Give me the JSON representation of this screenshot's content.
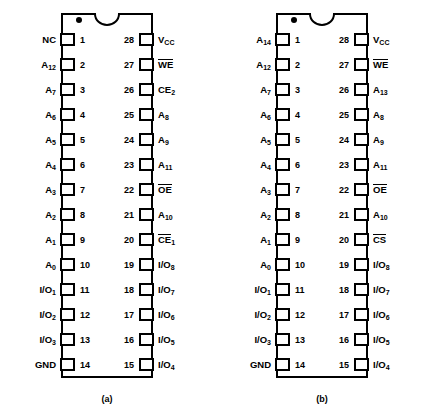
{
  "figure": {
    "pin_count": 28,
    "package": "28-pin DIP",
    "notch": "top-center-semicircle",
    "pin1_marker": "dot"
  },
  "chips": [
    {
      "caption": "(a)",
      "left_pins": [
        {
          "num": "1",
          "sig": "NC",
          "sub": "",
          "bar": false
        },
        {
          "num": "2",
          "sig": "A",
          "sub": "12",
          "bar": false
        },
        {
          "num": "3",
          "sig": "A",
          "sub": "7",
          "bar": false
        },
        {
          "num": "4",
          "sig": "A",
          "sub": "6",
          "bar": false
        },
        {
          "num": "5",
          "sig": "A",
          "sub": "5",
          "bar": false
        },
        {
          "num": "6",
          "sig": "A",
          "sub": "4",
          "bar": false
        },
        {
          "num": "7",
          "sig": "A",
          "sub": "3",
          "bar": false
        },
        {
          "num": "8",
          "sig": "A",
          "sub": "2",
          "bar": false
        },
        {
          "num": "9",
          "sig": "A",
          "sub": "1",
          "bar": false
        },
        {
          "num": "10",
          "sig": "A",
          "sub": "0",
          "bar": false
        },
        {
          "num": "11",
          "sig": "I/O",
          "sub": "1",
          "bar": false
        },
        {
          "num": "12",
          "sig": "I/O",
          "sub": "2",
          "bar": false
        },
        {
          "num": "13",
          "sig": "I/O",
          "sub": "3",
          "bar": false
        },
        {
          "num": "14",
          "sig": "GND",
          "sub": "",
          "bar": false
        }
      ],
      "right_pins": [
        {
          "num": "28",
          "sig": "V",
          "sub": "CC",
          "bar": false
        },
        {
          "num": "27",
          "sig": "WE",
          "sub": "",
          "bar": true
        },
        {
          "num": "26",
          "sig": "CE",
          "sub": "2",
          "bar": false
        },
        {
          "num": "25",
          "sig": "A",
          "sub": "8",
          "bar": false
        },
        {
          "num": "24",
          "sig": "A",
          "sub": "9",
          "bar": false
        },
        {
          "num": "23",
          "sig": "A",
          "sub": "11",
          "bar": false
        },
        {
          "num": "22",
          "sig": "OE",
          "sub": "",
          "bar": true
        },
        {
          "num": "21",
          "sig": "A",
          "sub": "10",
          "bar": false
        },
        {
          "num": "20",
          "sig": "CE",
          "sub": "1",
          "bar": true
        },
        {
          "num": "19",
          "sig": "I/O",
          "sub": "8",
          "bar": false
        },
        {
          "num": "18",
          "sig": "I/O",
          "sub": "7",
          "bar": false
        },
        {
          "num": "17",
          "sig": "I/O",
          "sub": "6",
          "bar": false
        },
        {
          "num": "16",
          "sig": "I/O",
          "sub": "5",
          "bar": false
        },
        {
          "num": "15",
          "sig": "I/O",
          "sub": "4",
          "bar": false
        }
      ]
    },
    {
      "caption": "(b)",
      "left_pins": [
        {
          "num": "1",
          "sig": "A",
          "sub": "14",
          "bar": false
        },
        {
          "num": "2",
          "sig": "A",
          "sub": "12",
          "bar": false
        },
        {
          "num": "3",
          "sig": "A",
          "sub": "7",
          "bar": false
        },
        {
          "num": "4",
          "sig": "A",
          "sub": "6",
          "bar": false
        },
        {
          "num": "5",
          "sig": "A",
          "sub": "5",
          "bar": false
        },
        {
          "num": "6",
          "sig": "A",
          "sub": "4",
          "bar": false
        },
        {
          "num": "7",
          "sig": "A",
          "sub": "3",
          "bar": false
        },
        {
          "num": "8",
          "sig": "A",
          "sub": "2",
          "bar": false
        },
        {
          "num": "9",
          "sig": "A",
          "sub": "1",
          "bar": false
        },
        {
          "num": "10",
          "sig": "A",
          "sub": "0",
          "bar": false
        },
        {
          "num": "11",
          "sig": "I/O",
          "sub": "1",
          "bar": false
        },
        {
          "num": "12",
          "sig": "I/O",
          "sub": "2",
          "bar": false
        },
        {
          "num": "13",
          "sig": "I/O",
          "sub": "3",
          "bar": false
        },
        {
          "num": "14",
          "sig": "GND",
          "sub": "",
          "bar": false
        }
      ],
      "right_pins": [
        {
          "num": "28",
          "sig": "V",
          "sub": "CC",
          "bar": false
        },
        {
          "num": "27",
          "sig": "WE",
          "sub": "",
          "bar": true
        },
        {
          "num": "26",
          "sig": "A",
          "sub": "13",
          "bar": false
        },
        {
          "num": "25",
          "sig": "A",
          "sub": "8",
          "bar": false
        },
        {
          "num": "24",
          "sig": "A",
          "sub": "9",
          "bar": false
        },
        {
          "num": "23",
          "sig": "A",
          "sub": "11",
          "bar": false
        },
        {
          "num": "22",
          "sig": "OE",
          "sub": "",
          "bar": true
        },
        {
          "num": "21",
          "sig": "A",
          "sub": "10",
          "bar": false
        },
        {
          "num": "20",
          "sig": "CS",
          "sub": "",
          "bar": true
        },
        {
          "num": "19",
          "sig": "I/O",
          "sub": "8",
          "bar": false
        },
        {
          "num": "18",
          "sig": "I/O",
          "sub": "7",
          "bar": false
        },
        {
          "num": "17",
          "sig": "I/O",
          "sub": "6",
          "bar": false
        },
        {
          "num": "16",
          "sig": "I/O",
          "sub": "5",
          "bar": false
        },
        {
          "num": "15",
          "sig": "I/O",
          "sub": "4",
          "bar": false
        }
      ]
    }
  ]
}
